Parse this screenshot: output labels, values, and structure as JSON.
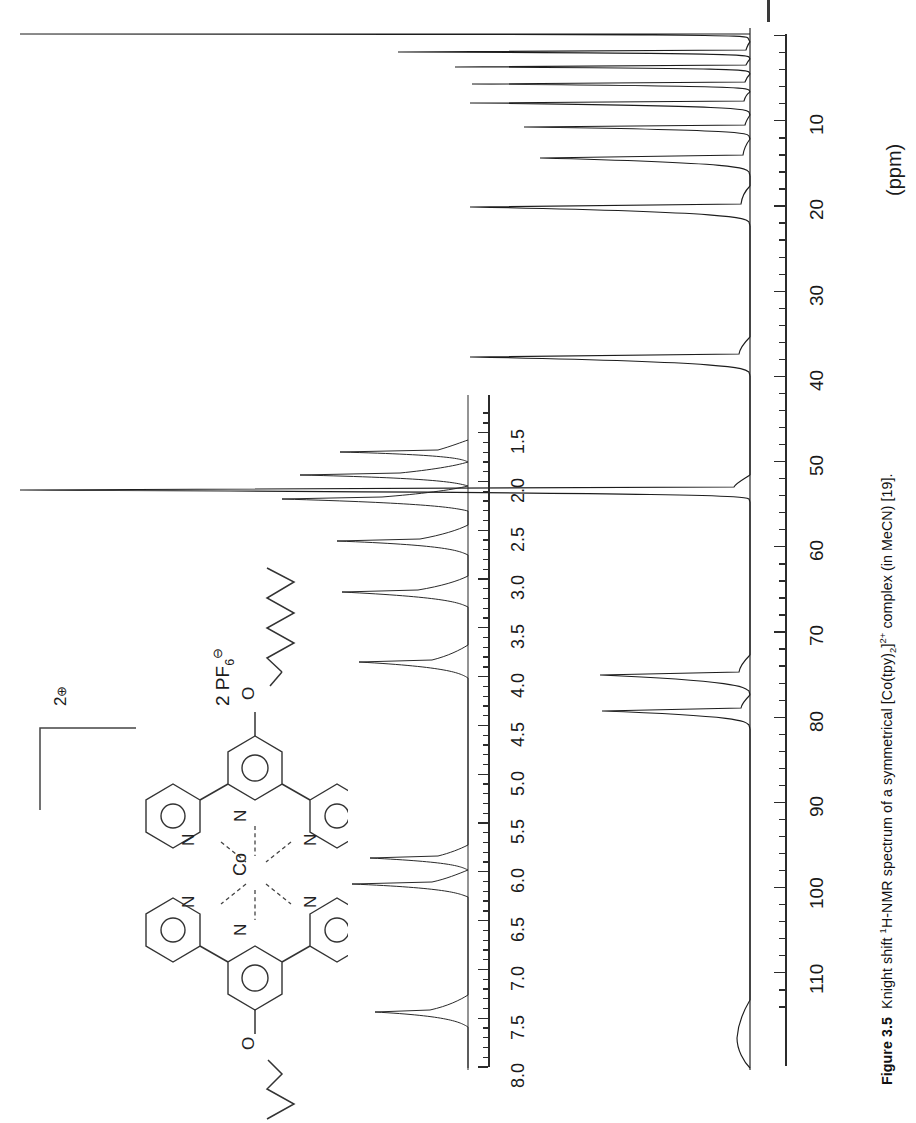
{
  "figure": {
    "number": "Figure 3.5",
    "caption_parts": {
      "lead": "Knight shift ",
      "sup1": "1",
      "mid": "H-NMR spectrum of a symmetrical [Co(tpy)",
      "sub1": "2",
      "mid2": "]",
      "sup2": "2+",
      "tail": " complex (in MeCN) [19]."
    },
    "caption_full": "Figure 3.5  Knight shift 1H-NMR spectrum of a symmetrical [Co(tpy)2]2+ complex (in MeCN) [19]."
  },
  "main_axis": {
    "label": "(ppm)",
    "unit": "ppm",
    "tick_labels": [
      "10",
      "20",
      "30",
      "40",
      "50",
      "60",
      "70",
      "80",
      "90",
      "100",
      "110"
    ],
    "range": [
      0,
      115
    ],
    "major_step": 10,
    "minor_step": 2,
    "orientation": "vertical-rotated",
    "direction": "increasing-downward"
  },
  "inset_axis": {
    "tick_labels": [
      "1.5",
      "2.0",
      "2.5",
      "3.0",
      "3.5",
      "4.0",
      "4.5",
      "5.0",
      "5.5",
      "6.0",
      "6.5",
      "7.0",
      "7.5",
      "8.0"
    ],
    "range": [
      1.3,
      8.2
    ],
    "major_step": 0.5,
    "minor_step": 0.1,
    "unit": "ppm",
    "orientation": "vertical-rotated",
    "direction": "decreasing-upward"
  },
  "structure": {
    "name": "Co(tpy)2 complex",
    "metal": "Co",
    "charge_number": "2",
    "charge_sign": "⊕",
    "counterion_count": "2",
    "counterion": "PF",
    "counterion_sub": "6",
    "counterion_sign": "⊖",
    "donor_atoms": [
      "N",
      "N",
      "N",
      "N",
      "N",
      "N"
    ],
    "ether_atoms": [
      "O",
      "O"
    ],
    "atom_labels": [
      "Co",
      "N",
      "N",
      "N",
      "N",
      "N",
      "N",
      "O",
      "O"
    ]
  },
  "chart_data": {
    "type": "line",
    "title": "Knight shift 1H-NMR spectrum of a symmetrical [Co(tpy)2]2+ complex (in MeCN)",
    "xlabel": "(ppm)",
    "ylabel": "Intensity",
    "grid": false,
    "legend": "none",
    "panels": [
      {
        "name": "main-spectrum",
        "xlim": [
          115,
          0
        ],
        "xlabel": "(ppm)",
        "ticks": [
          10,
          20,
          30,
          40,
          50,
          60,
          70,
          80,
          90,
          100,
          110
        ],
        "peaks": [
          {
            "ppm": 0.8,
            "height": 0.97,
            "width": 0.45
          },
          {
            "ppm": 2.1,
            "height": 0.74,
            "width": 0.4
          },
          {
            "ppm": 3.4,
            "height": 0.68,
            "width": 0.4
          },
          {
            "ppm": 4.9,
            "height": 0.62,
            "width": 0.45
          },
          {
            "ppm": 6.5,
            "height": 0.8,
            "width": 0.55
          },
          {
            "ppm": 8.3,
            "height": 0.56,
            "width": 0.6
          },
          {
            "ppm": 14.8,
            "height": 0.85,
            "width": 0.7
          },
          {
            "ppm": 33.8,
            "height": 0.82,
            "width": 0.8
          },
          {
            "ppm": 50.0,
            "height": 1.0,
            "width": 0.6
          },
          {
            "ppm": 68.8,
            "height": 0.42,
            "width": 0.75
          },
          {
            "ppm": 72.8,
            "height": 0.48,
            "width": 0.75
          },
          {
            "ppm": 112.0,
            "height": 0.1,
            "width": 2.2
          }
        ]
      },
      {
        "name": "inset-spectrum",
        "xlim": [
          8.2,
          1.3
        ],
        "ticks": [
          1.5,
          2.0,
          2.5,
          3.0,
          3.5,
          4.0,
          4.5,
          5.0,
          5.5,
          6.0,
          6.5,
          7.0,
          7.5,
          8.0
        ],
        "peaks": [
          {
            "ppm": 1.55,
            "height": 0.42,
            "width": 0.035
          },
          {
            "ppm": 2.1,
            "height": 0.95,
            "width": 0.045
          },
          {
            "ppm": 2.35,
            "height": 1.0,
            "width": 0.05
          },
          {
            "ppm": 3.05,
            "height": 0.72,
            "width": 0.045
          },
          {
            "ppm": 3.62,
            "height": 0.7,
            "width": 0.045
          },
          {
            "ppm": 4.4,
            "height": 0.56,
            "width": 0.045
          },
          {
            "ppm": 6.32,
            "height": 0.48,
            "width": 0.04
          },
          {
            "ppm": 6.55,
            "height": 0.52,
            "width": 0.045
          },
          {
            "ppm": 7.8,
            "height": 0.4,
            "width": 0.045
          }
        ]
      }
    ]
  }
}
